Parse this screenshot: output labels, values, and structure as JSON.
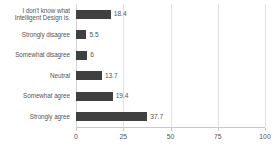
{
  "chart_data": {
    "type": "bar",
    "orientation": "horizontal",
    "title": "",
    "xlabel": "",
    "ylabel": "",
    "xlim": [
      0,
      100
    ],
    "xticks": [
      0,
      25,
      50,
      75,
      100
    ],
    "xtick_labels": [
      "0",
      "25",
      "50",
      "75",
      "100"
    ],
    "grid": true,
    "legend": false,
    "bar_color": "#404040",
    "gridline_color": "#e2e2e2",
    "axis_color": "#c9c9c9",
    "text_color": "#555555",
    "categories": [
      "I don't know what Intelligent Design is.",
      "Strongly disagree",
      "Somewhat disagree",
      "Neutral",
      "Somewhat agree",
      "Strongly agree"
    ],
    "category_lines": [
      [
        "I don't know what",
        "Intelligent Design is."
      ],
      [
        "Strongly disagree"
      ],
      [
        "Somewhat disagree"
      ],
      [
        "Neutral"
      ],
      [
        "Somewhat agree"
      ],
      [
        "Strongly agree"
      ]
    ],
    "values": [
      18.4,
      5.5,
      6,
      13.7,
      19.4,
      37.7
    ],
    "value_labels": [
      "18.4",
      "5.5",
      "6",
      "13.7",
      "19.4",
      "37.7"
    ]
  }
}
